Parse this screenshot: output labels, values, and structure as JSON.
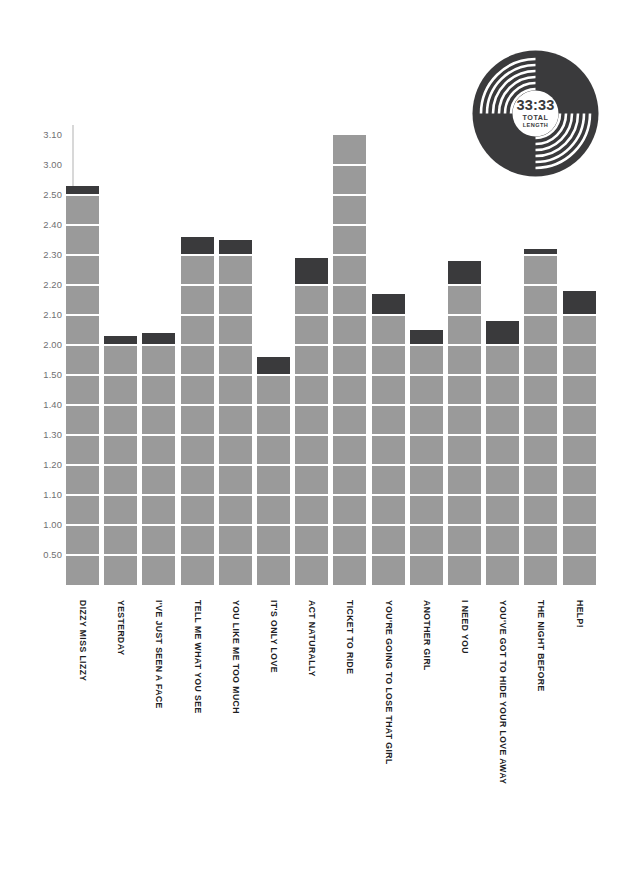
{
  "record": {
    "total_time": "33:33",
    "label_line1": "TOTAL",
    "label_line2": "LENGTH",
    "icon": "vinyl-record-icon",
    "color": "#3a3a3c"
  },
  "colors": {
    "bar": "#9a9a9a",
    "bar_cap": "#3a3a3c",
    "gridline": "#ffffff",
    "axis": "#d8d8d8",
    "tick_text": "#6f6f71",
    "label_text": "#1d1d1f",
    "background": "#ffffff"
  },
  "chart_data": {
    "type": "bar",
    "title": "",
    "subtitle": "",
    "xlabel": "",
    "ylabel": "",
    "grid": true,
    "legend": "none",
    "note": "Y axis in minutes.seconds (m.ss); gridlines every 10 seconds. Grey blocks = full 10-second gridline steps, dark cap = remaining seconds above the last gridline.",
    "ytick_labels": [
      "3.10",
      "3.00",
      "2.50",
      "2.40",
      "2.30",
      "2.20",
      "2.10",
      "2.00",
      "1.50",
      "1.40",
      "1.30",
      "1.20",
      "1.10",
      "1.00",
      "0.50"
    ],
    "ylim_seconds": [
      0,
      190
    ],
    "categories": [
      "DIZZY MISS LIZZY",
      "YESTERDAY",
      "I'VE JUST SEEN A FACE",
      "TELL ME WHAT YOU SEE",
      "YOU LIKE ME TOO MUCH",
      "IT'S ONLY LOVE",
      "ACT NATURALLY",
      "TICKET TO RIDE",
      "YOU'RE GOING TO LOSE THAT GIRL",
      "ANOTHER GIRL",
      "I NEED YOU",
      "YOU'VE GOT TO HIDE YOUR LOVE AWAY",
      "THE NIGHT BEFORE",
      "HELP!"
    ],
    "values": [
      "2:53",
      "2:03",
      "2:04",
      "2:36",
      "2:35",
      "1:56",
      "2:29",
      "3:10",
      "2:17",
      "2:05",
      "2:28",
      "2:08",
      "2:32",
      "2:18"
    ],
    "values_seconds": [
      173,
      123,
      124,
      156,
      155,
      116,
      149,
      190,
      137,
      125,
      148,
      128,
      152,
      138
    ]
  }
}
